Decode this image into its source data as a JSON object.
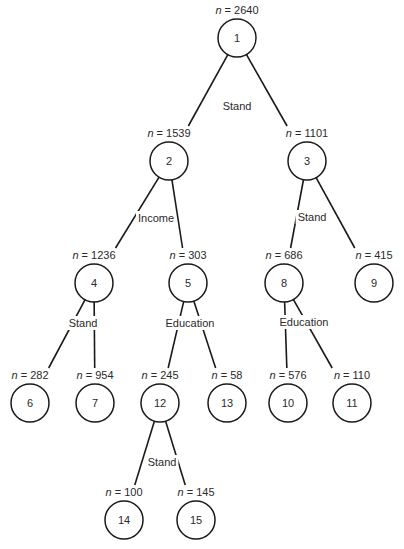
{
  "diagram": {
    "type": "decision-tree",
    "nodes": [
      {
        "id": "1",
        "n": "2640",
        "x": 237,
        "y": 38
      },
      {
        "id": "2",
        "n": "1539",
        "x": 169,
        "y": 161
      },
      {
        "id": "3",
        "n": "1101",
        "x": 307,
        "y": 161
      },
      {
        "id": "4",
        "n": "1236",
        "x": 94,
        "y": 283
      },
      {
        "id": "5",
        "n": "303",
        "x": 188,
        "y": 283
      },
      {
        "id": "8",
        "n": "686",
        "x": 284,
        "y": 283
      },
      {
        "id": "9",
        "n": "415",
        "x": 374,
        "y": 283
      },
      {
        "id": "6",
        "n": "282",
        "x": 30,
        "y": 403
      },
      {
        "id": "7",
        "n": "954",
        "x": 95,
        "y": 403
      },
      {
        "id": "12",
        "n": "245",
        "x": 160,
        "y": 403
      },
      {
        "id": "13",
        "n": "58",
        "x": 227,
        "y": 403
      },
      {
        "id": "10",
        "n": "576",
        "x": 288,
        "y": 403
      },
      {
        "id": "11",
        "n": "110",
        "x": 352,
        "y": 403
      },
      {
        "id": "14",
        "n": "100",
        "x": 124,
        "y": 520
      },
      {
        "id": "15",
        "n": "145",
        "x": 196,
        "y": 520
      }
    ],
    "edges": [
      {
        "from": "1",
        "to": "2"
      },
      {
        "from": "1",
        "to": "3"
      },
      {
        "from": "2",
        "to": "4"
      },
      {
        "from": "2",
        "to": "5"
      },
      {
        "from": "3",
        "to": "8"
      },
      {
        "from": "3",
        "to": "9"
      },
      {
        "from": "4",
        "to": "6"
      },
      {
        "from": "4",
        "to": "7"
      },
      {
        "from": "5",
        "to": "12"
      },
      {
        "from": "5",
        "to": "13"
      },
      {
        "from": "8",
        "to": "10"
      },
      {
        "from": "8",
        "to": "11"
      },
      {
        "from": "12",
        "to": "14"
      },
      {
        "from": "12",
        "to": "15"
      }
    ],
    "splits": [
      {
        "node": "1",
        "variable": "Stand",
        "x": 237,
        "y": 110
      },
      {
        "node": "2",
        "variable": "Income",
        "x": 156,
        "y": 222
      },
      {
        "node": "3",
        "variable": "Stand",
        "x": 312,
        "y": 221
      },
      {
        "node": "4",
        "variable": "Stand",
        "x": 83,
        "y": 327
      },
      {
        "node": "5",
        "variable": "Education",
        "x": 190,
        "y": 327
      },
      {
        "node": "8",
        "variable": "Education",
        "x": 304,
        "y": 326
      },
      {
        "node": "12",
        "variable": "Stand",
        "x": 162,
        "y": 466
      }
    ],
    "n_prefix": "n = ",
    "node_radius": 19
  }
}
